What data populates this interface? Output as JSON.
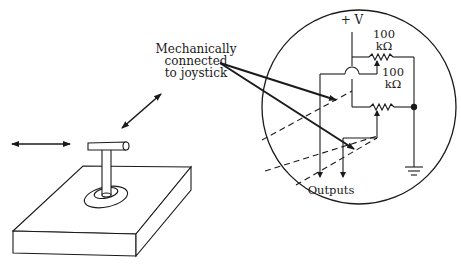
{
  "diagram": {
    "labels": {
      "mech_line1": "Mechanically",
      "mech_line2": "connected",
      "mech_line3": "to joystick",
      "supply": "+ V",
      "r1_value": "100",
      "r1_unit": "kΩ",
      "r2_value": "100",
      "r2_unit": "kΩ",
      "outputs": "Outputs"
    },
    "components": [
      {
        "type": "joystick",
        "description": "T-handle joystick on rectangular base"
      },
      {
        "type": "potentiometer",
        "value": "100 kΩ",
        "position": "top"
      },
      {
        "type": "potentiometer",
        "value": "100 kΩ",
        "position": "bottom"
      },
      {
        "type": "ground"
      },
      {
        "type": "supply",
        "label": "+V"
      }
    ],
    "arrows": [
      {
        "type": "double-headed",
        "direction": "horizontal",
        "meaning": "left-right motion"
      },
      {
        "type": "double-headed",
        "direction": "diagonal",
        "meaning": "forward-back motion"
      }
    ],
    "colors": {
      "ink": "#1a1a1a",
      "background": "#ffffff"
    }
  }
}
